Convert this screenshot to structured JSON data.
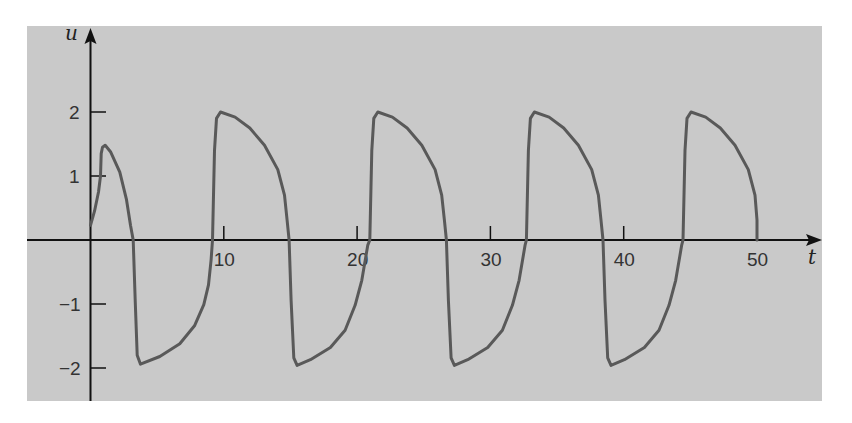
{
  "chart_data": {
    "type": "line",
    "title": "",
    "xlabel": "t",
    "ylabel": "u",
    "xlim": [
      0,
      53
    ],
    "ylim": [
      -2.5,
      2.55
    ],
    "grid": false,
    "legend": null,
    "x_ticks": [
      10,
      20,
      30,
      40,
      50
    ],
    "x_tick_labels": [
      "10",
      "20",
      "30",
      "40",
      "50"
    ],
    "y_ticks": [
      2,
      1,
      -1,
      -2
    ],
    "y_tick_labels": [
      "2",
      "1",
      "−1",
      "−2"
    ],
    "colors": {
      "panel": "#c9c9c9",
      "curve": "#595959",
      "axis": "#111111"
    },
    "series": [
      {
        "name": "u(t)",
        "points": [
          [
            0,
            0.23
          ],
          [
            0.3,
            0.45
          ],
          [
            0.6,
            0.75
          ],
          [
            0.75,
            1.0
          ],
          [
            0.8,
            1.35
          ],
          [
            0.9,
            1.45
          ],
          [
            1.1,
            1.48
          ],
          [
            1.5,
            1.38
          ],
          [
            2.2,
            1.06
          ],
          [
            2.7,
            0.63
          ],
          [
            3.0,
            0.23
          ],
          [
            3.2,
            0
          ],
          [
            3.35,
            -0.94
          ],
          [
            3.5,
            -1.8
          ],
          [
            3.75,
            -1.94
          ],
          [
            5.2,
            -1.82
          ],
          [
            6.7,
            -1.62
          ],
          [
            7.8,
            -1.34
          ],
          [
            8.5,
            -1.01
          ],
          [
            8.85,
            -0.7
          ],
          [
            9.05,
            -0.31
          ],
          [
            9.15,
            0
          ],
          [
            9.3,
            1.4
          ],
          [
            9.45,
            1.9
          ],
          [
            9.75,
            2.0
          ],
          [
            10.85,
            1.92
          ],
          [
            11.95,
            1.75
          ],
          [
            13.05,
            1.48
          ],
          [
            14.05,
            1.1
          ],
          [
            14.55,
            0.7
          ],
          [
            14.75,
            0.31
          ],
          [
            14.9,
            0
          ],
          [
            15.05,
            -0.94
          ],
          [
            15.25,
            -1.84
          ],
          [
            15.5,
            -1.96
          ],
          [
            16.5,
            -1.87
          ],
          [
            18.0,
            -1.68
          ],
          [
            19.1,
            -1.41
          ],
          [
            19.85,
            -1.02
          ],
          [
            20.35,
            -0.63
          ],
          [
            20.8,
            -0.08
          ],
          [
            20.95,
            0
          ],
          [
            21.1,
            1.4
          ],
          [
            21.25,
            1.9
          ],
          [
            21.55,
            2.0
          ],
          [
            22.65,
            1.92
          ],
          [
            23.75,
            1.75
          ],
          [
            24.85,
            1.48
          ],
          [
            25.85,
            1.1
          ],
          [
            26.35,
            0.7
          ],
          [
            26.55,
            0.31
          ],
          [
            26.7,
            0
          ],
          [
            26.85,
            -0.94
          ],
          [
            27.05,
            -1.84
          ],
          [
            27.3,
            -1.96
          ],
          [
            28.3,
            -1.87
          ],
          [
            29.8,
            -1.68
          ],
          [
            30.9,
            -1.41
          ],
          [
            31.65,
            -1.02
          ],
          [
            32.15,
            -0.63
          ],
          [
            32.6,
            -0.08
          ],
          [
            32.7,
            0
          ],
          [
            32.85,
            1.4
          ],
          [
            33.0,
            1.9
          ],
          [
            33.3,
            2.0
          ],
          [
            34.4,
            1.92
          ],
          [
            35.5,
            1.75
          ],
          [
            36.6,
            1.48
          ],
          [
            37.6,
            1.1
          ],
          [
            38.1,
            0.7
          ],
          [
            38.3,
            0.31
          ],
          [
            38.45,
            0
          ],
          [
            38.6,
            -0.94
          ],
          [
            38.8,
            -1.84
          ],
          [
            39.05,
            -1.96
          ],
          [
            40.05,
            -1.87
          ],
          [
            41.55,
            -1.68
          ],
          [
            42.65,
            -1.41
          ],
          [
            43.4,
            -1.02
          ],
          [
            43.9,
            -0.63
          ],
          [
            44.35,
            -0.08
          ],
          [
            44.45,
            0
          ],
          [
            44.6,
            1.4
          ],
          [
            44.75,
            1.9
          ],
          [
            45.05,
            2.0
          ],
          [
            46.15,
            1.92
          ],
          [
            47.25,
            1.75
          ],
          [
            48.35,
            1.48
          ],
          [
            49.35,
            1.1
          ],
          [
            49.85,
            0.7
          ],
          [
            50.0,
            0.31
          ],
          [
            50.0,
            0
          ]
        ]
      }
    ]
  }
}
